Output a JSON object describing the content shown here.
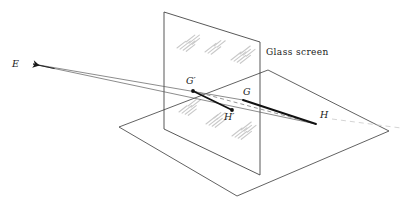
{
  "figure": {
    "name": "perspective-projection-glass-screen",
    "background_color": "#ffffff",
    "width": 407,
    "height": 208
  },
  "labels": {
    "eye": "E",
    "g_prime": "G′",
    "g": "G",
    "h_prime": "H′",
    "h": "H",
    "screen_caption": "Glass screen"
  },
  "colors": {
    "ink": "#1a1a1a",
    "thin_ray": "#5a5a5a",
    "plane_edge": "#3a3a3a",
    "hatch": "#c9c9c9",
    "dashed": "#7a7a7a",
    "faint_dash": "#cfcfcf"
  },
  "geometry": {
    "ground_plane": [
      [
        119,
        127
      ],
      [
        237,
        196
      ],
      [
        389,
        131
      ],
      [
        268,
        70
      ]
    ],
    "screen_quad": [
      [
        164,
        12
      ],
      [
        260,
        42
      ],
      [
        260,
        175
      ],
      [
        164,
        129
      ]
    ],
    "points": {
      "E": [
        33,
        64
      ],
      "G_prime": [
        193,
        91
      ],
      "G": [
        243,
        100
      ],
      "H_prime": [
        232,
        110
      ],
      "H": [
        316,
        124
      ]
    },
    "label_positions": {
      "E": [
        12,
        67
      ],
      "G_prime": [
        186,
        84
      ],
      "G": [
        243,
        95
      ],
      "H_prime": [
        224,
        120
      ],
      "H": [
        320,
        118
      ],
      "screen_caption": [
        266,
        55
      ]
    },
    "ray_E_to_H": [
      [
        33,
        64
      ],
      [
        316,
        124
      ]
    ],
    "ray_E_to_G": [
      [
        33,
        64
      ],
      [
        243,
        100
      ]
    ],
    "thick_GprimeHprime": [
      [
        193,
        91
      ],
      [
        232,
        110
      ]
    ],
    "thick_G_to_H": [
      [
        243,
        100
      ],
      [
        316,
        124
      ]
    ],
    "dashed_Gprime_to_H": [
      [
        193,
        91
      ],
      [
        316,
        124
      ]
    ],
    "faint_dash_right": [
      [
        332,
        119
      ],
      [
        401,
        128
      ]
    ],
    "hatch_angle_deg": -38,
    "hatch_clusters": [
      {
        "x": 177,
        "y": 48,
        "strokes": 4,
        "len": 15
      },
      {
        "x": 186,
        "y": 42,
        "strokes": 3,
        "len": 13
      },
      {
        "x": 205,
        "y": 52,
        "strokes": 3,
        "len": 14
      },
      {
        "x": 214,
        "y": 46,
        "strokes": 2,
        "len": 12
      },
      {
        "x": 231,
        "y": 60,
        "strokes": 4,
        "len": 15
      },
      {
        "x": 240,
        "y": 54,
        "strokes": 3,
        "len": 13
      },
      {
        "x": 179,
        "y": 112,
        "strokes": 4,
        "len": 14
      },
      {
        "x": 188,
        "y": 106,
        "strokes": 2,
        "len": 12
      },
      {
        "x": 206,
        "y": 124,
        "strokes": 4,
        "len": 15
      },
      {
        "x": 214,
        "y": 118,
        "strokes": 2,
        "len": 12
      },
      {
        "x": 232,
        "y": 136,
        "strokes": 4,
        "len": 15
      },
      {
        "x": 241,
        "y": 130,
        "strokes": 3,
        "len": 13
      }
    ]
  }
}
